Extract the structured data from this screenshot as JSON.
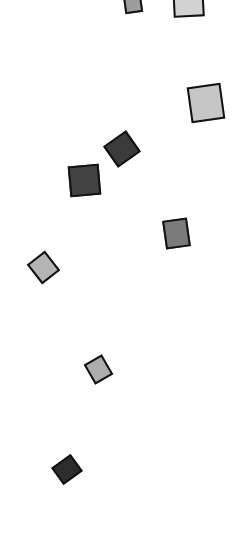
{
  "scene": {
    "description": "Scattered tilted gray squares with dark outlines on white background",
    "background": "#ffffff",
    "outline_color": "#111111",
    "tiles": [
      {
        "name": "tile-top-small-gray",
        "x": 124,
        "y": -6,
        "w": 18,
        "h": 19,
        "rotate": -8,
        "fill": "#9c9c9c"
      },
      {
        "name": "tile-top-light",
        "x": 173,
        "y": -14,
        "w": 31,
        "h": 31,
        "rotate": -3,
        "fill": "#d2d2d2"
      },
      {
        "name": "tile-right-large-light",
        "x": 189,
        "y": 85,
        "w": 34,
        "h": 36,
        "rotate": -8,
        "fill": "#c6c6c6"
      },
      {
        "name": "tile-dark-diamond",
        "x": 108,
        "y": 136,
        "w": 28,
        "h": 26,
        "rotate": -35,
        "fill": "#3b3b3b"
      },
      {
        "name": "tile-dark-square",
        "x": 69,
        "y": 165,
        "w": 31,
        "h": 31,
        "rotate": -5,
        "fill": "#424242"
      },
      {
        "name": "tile-mid-gray",
        "x": 164,
        "y": 219,
        "w": 25,
        "h": 29,
        "rotate": -8,
        "fill": "#7b7b7b"
      },
      {
        "name": "tile-left-light-diamond",
        "x": 32,
        "y": 255,
        "w": 23,
        "h": 25,
        "rotate": -38,
        "fill": "#b4b4b4"
      },
      {
        "name": "tile-small-light",
        "x": 88,
        "y": 358,
        "w": 21,
        "h": 23,
        "rotate": -30,
        "fill": "#adadad"
      },
      {
        "name": "tile-bottom-dark",
        "x": 55,
        "y": 459,
        "w": 24,
        "h": 21,
        "rotate": -36,
        "fill": "#2d2d2d"
      }
    ]
  }
}
